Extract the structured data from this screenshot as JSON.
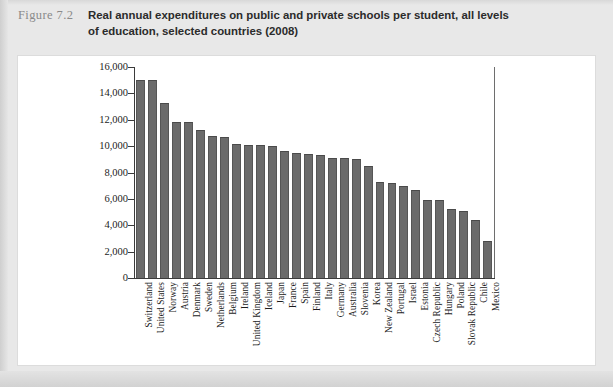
{
  "figure": {
    "label": "Figure 7.2",
    "title": "Real annual expenditures on public and private schools per student, all levels of education, selected countries (2008)"
  },
  "chart_data": {
    "type": "bar",
    "title": "Real annual expenditures on public and private schools per student, all levels of education, selected countries (2008)",
    "xlabel": "",
    "ylabel": "",
    "ylim": [
      0,
      16000
    ],
    "ytick_labels": [
      "16,000",
      "14,000",
      "12,000",
      "10,000",
      "8,000",
      "6,000",
      "4,000",
      "2,000",
      "0"
    ],
    "ytick_values": [
      16000,
      14000,
      12000,
      10000,
      8000,
      6000,
      4000,
      2000,
      0
    ],
    "grid": false,
    "legend": "none",
    "bar_color": "#6b6b6b",
    "categories": [
      "Switzerland",
      "United States",
      "Norway",
      "Austria",
      "Denmark",
      "Sweden",
      "Netherlands",
      "Belgium",
      "Ireland",
      "United Kingdom",
      "Iceland",
      "Japan",
      "France",
      "Spain",
      "Finland",
      "Italy",
      "Germany",
      "Australia",
      "Slovenia",
      "Korea",
      "New Zealand",
      "Portugal",
      "Israel",
      "Estonia",
      "Czech Republic",
      "Hungary",
      "Poland",
      "Slovak Republic",
      "Chile",
      "Mexico"
    ],
    "values": [
      15000,
      15000,
      13300,
      11800,
      11800,
      11200,
      10800,
      10700,
      10200,
      10100,
      10100,
      10000,
      9600,
      9500,
      9400,
      9300,
      9100,
      9100,
      9000,
      8500,
      7300,
      7200,
      7000,
      6700,
      5900,
      5900,
      5200,
      5100,
      4400,
      2800
    ]
  }
}
